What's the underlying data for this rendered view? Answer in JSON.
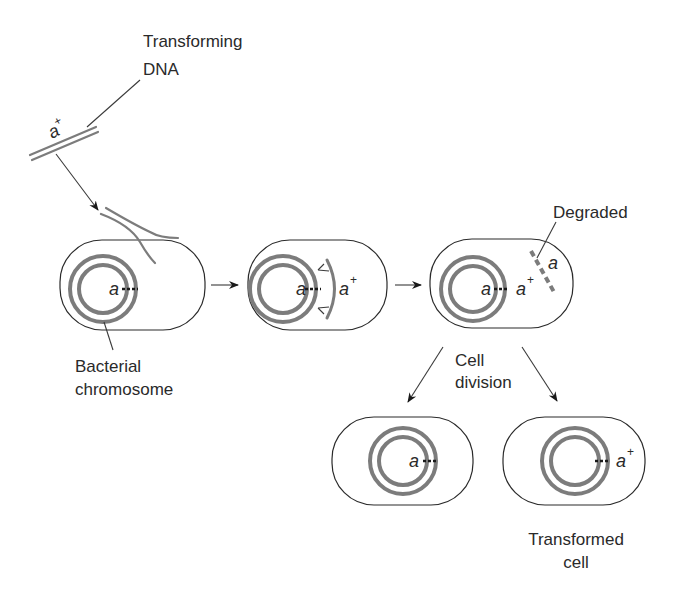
{
  "labels": {
    "transforming_dna_line1": "Transforming",
    "transforming_dna_line2": "DNA",
    "bacterial_chromosome_line1": "Bacterial",
    "bacterial_chromosome_line2": "chromosome",
    "degraded": "Degraded",
    "cell_division_line1": "Cell",
    "cell_division_line2": "division",
    "transformed_cell_line1": "Transformed",
    "transformed_cell_line2": "cell"
  },
  "genes": {
    "donor_allele": "a",
    "donor_allele_sup": "+",
    "recipient_allele": "a",
    "plus_sup": "+"
  },
  "cells": [
    {
      "id": "cell-1-uptake",
      "chromosome_allele": "a",
      "note": "DNA entering cell"
    },
    {
      "id": "cell-2-pairing",
      "chromosome_allele": "a",
      "paired_allele": "a+"
    },
    {
      "id": "cell-3-recombined",
      "chromosome_alleles": [
        "a",
        "a+"
      ],
      "degraded_allele": "a"
    },
    {
      "id": "cell-4-daughter",
      "chromosome_allele": "a"
    },
    {
      "id": "cell-5-transformed",
      "chromosome_allele": "a+"
    }
  ],
  "colors": {
    "outline": "#2a2a2a",
    "dna": "#7c7c7c",
    "text": "#2a2a2a"
  }
}
